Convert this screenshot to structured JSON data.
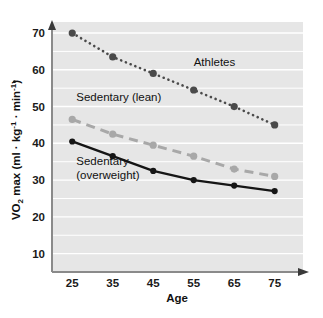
{
  "chart_data": {
    "type": "line",
    "title": "",
    "xlabel": "Age",
    "ylabel": "VO2 max (ml · kg-1 · min-1)",
    "ylabel_parts": {
      "v_dot": "V",
      "o": "O",
      "two": "2",
      "max": " max (ml · kg",
      "exp1": "-1",
      "mid": " · min",
      "exp2": "-1",
      "close": ")"
    },
    "categories": [
      25,
      35,
      45,
      55,
      65,
      75
    ],
    "x_tick_labels": [
      "25",
      "35",
      "45",
      "55",
      "65",
      "75"
    ],
    "y_tick_labels": [
      "10",
      "20",
      "30",
      "40",
      "50",
      "60",
      "70"
    ],
    "y_ticks": [
      10,
      20,
      30,
      40,
      50,
      60,
      70
    ],
    "ylim": [
      5,
      73
    ],
    "xlim": [
      20,
      82
    ],
    "grid": "horizontal-minor-5",
    "gridline_step": 5,
    "legend_position": "inline-annotations",
    "plot_background": "#e6e6e6",
    "gridline_color": "#ffffff",
    "series": [
      {
        "name": "Athletes",
        "label": "Athletes",
        "style": "dotted",
        "color": "#4a4a4a",
        "marker": "circle",
        "values": [
          70,
          63.5,
          59,
          54.5,
          50,
          45
        ],
        "label_x": 55,
        "label_y": 61
      },
      {
        "name": "Sedentary (lean)",
        "label": "Sedentary (lean)",
        "style": "dashed",
        "color": "#a8a8a8",
        "marker": "circle",
        "values": [
          46.5,
          42.5,
          39.5,
          36.5,
          33,
          31
        ],
        "label_x": 26,
        "label_y": 51.5
      },
      {
        "name": "Sedentary (overweight)",
        "label_line1": "Sedentary",
        "label_line2": "(overweight)",
        "style": "solid",
        "color": "#151515",
        "marker": "circle",
        "values": [
          40.5,
          36.5,
          32.5,
          30,
          28.5,
          27
        ],
        "label_x": 26,
        "label_y": 34
      }
    ]
  }
}
